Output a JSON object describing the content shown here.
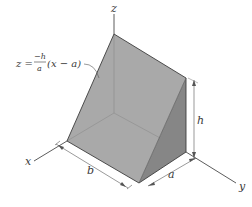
{
  "figure": {
    "axes": {
      "x": "x",
      "y": "y",
      "z": "z"
    },
    "equation": {
      "lhs": "z =",
      "numerator": "−h",
      "denominator": "a",
      "rhs": "(x − a)"
    },
    "dimensions": {
      "length": "b",
      "width": "a",
      "height": "h"
    },
    "colors": {
      "slanted_face": "#a8a8a8",
      "bottom_face": "#b4b4b4",
      "side_face": "#858585",
      "edge": "#3c3c3c",
      "axis": "#4a4a4a",
      "dimension_line": "#555555",
      "background": "#ffffff"
    }
  }
}
